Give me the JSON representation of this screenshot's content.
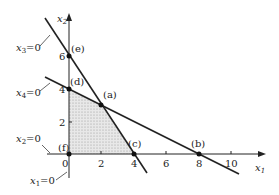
{
  "diagram": {
    "type": "linear-programming-feasible-region",
    "axes": {
      "x_label": "x",
      "x_sub": "1",
      "y_label": "x",
      "y_sub": "2",
      "x_ticks": [
        "0",
        "2",
        "4",
        "6",
        "8",
        "10"
      ],
      "y_ticks": [
        "2",
        "4",
        "6"
      ]
    },
    "constraint_labels": [
      {
        "id": "x3",
        "var": "x",
        "sub": "3",
        "eq": "=0"
      },
      {
        "id": "x4",
        "var": "x",
        "sub": "4",
        "eq": "=0"
      },
      {
        "id": "x2",
        "var": "x",
        "sub": "2",
        "eq": "=0"
      },
      {
        "id": "x1",
        "var": "x",
        "sub": "1",
        "eq": "=0"
      }
    ],
    "points": [
      {
        "label": "(a)",
        "x": 2,
        "y": 3
      },
      {
        "label": "(b)",
        "x": 8,
        "y": 0
      },
      {
        "label": "(c)",
        "x": 4,
        "y": 0
      },
      {
        "label": "(d)",
        "x": 0,
        "y": 4
      },
      {
        "label": "(e)",
        "x": 0,
        "y": 6
      },
      {
        "label": "(f)",
        "x": 0,
        "y": 0
      }
    ],
    "feasible_region": "polygon (0,0),(4,0),(2,3),(0,4)"
  }
}
